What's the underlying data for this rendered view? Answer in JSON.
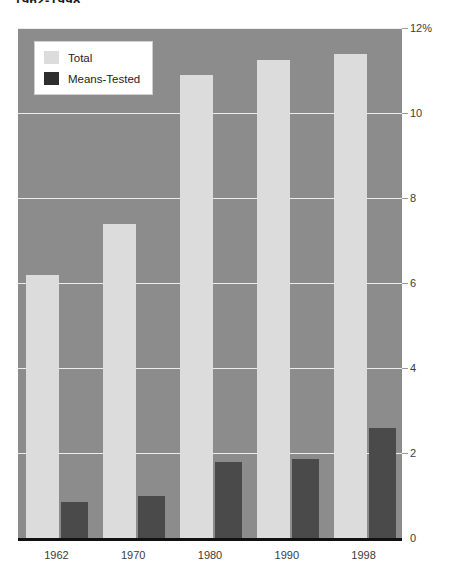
{
  "title": "1962-1998",
  "legend": {
    "items": [
      {
        "label": "Total",
        "color": "#dcdcdc",
        "key": "total"
      },
      {
        "label": "Means-Tested",
        "color": "#2e2e2e",
        "key": "means"
      }
    ]
  },
  "axis": {
    "y_ticks": [
      "0",
      "2",
      "4",
      "6",
      "8",
      "10",
      "12%"
    ],
    "x_ticks": [
      "1962",
      "1970",
      "1980",
      "1990",
      "1998"
    ]
  },
  "chart_data": {
    "type": "bar",
    "title": "1962-1998",
    "xlabel": "",
    "ylabel": "",
    "ylim": [
      0,
      12
    ],
    "yticks": [
      0,
      2,
      4,
      6,
      8,
      10,
      12
    ],
    "ytick_labels": [
      "0",
      "2",
      "4",
      "6",
      "8",
      "10",
      "12%"
    ],
    "grid": true,
    "legend_position": "top-left",
    "categories": [
      "1962",
      "1970",
      "1980",
      "1990",
      "1998"
    ],
    "series": [
      {
        "name": "Total",
        "color": "#dcdcdc",
        "values": [
          6.2,
          7.4,
          10.9,
          11.25,
          11.4
        ]
      },
      {
        "name": "Means-Tested",
        "color": "#4a4a4a",
        "values": [
          0.85,
          1.0,
          1.8,
          1.85,
          2.6
        ]
      }
    ],
    "plot_background": "#8c8c8c",
    "gridline_color": "#ececed",
    "axis_color": "#111111"
  }
}
